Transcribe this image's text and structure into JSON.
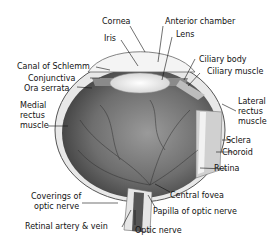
{
  "diagram": {
    "labels": {
      "cornea": "Cornea",
      "anterior_chamber": "Anterior chamber",
      "iris": "Iris",
      "lens": "Lens",
      "canal_of_schlemm": "Canal of Schlemm",
      "ciliary_body": "Ciliary body",
      "conjunctiva": "Conjunctiva",
      "ciliary_muscle": "Ciliary muscle",
      "ora_serrata": "Ora serrata",
      "medial_rectus_1": "Medial",
      "medial_rectus_2": "rectus",
      "medial_rectus_3": "muscle",
      "lateral_rectus_1": "Lateral",
      "lateral_rectus_2": "rectus",
      "lateral_rectus_3": "muscle",
      "sclera": "Sclera",
      "choroid": "Choroid",
      "retina": "Retina",
      "coverings_1": "Coverings of",
      "coverings_2": "optic nerve",
      "central_fovea": "Central fovea",
      "papilla": "Papilla of optic nerve",
      "retinal_artery_vein": "Retinal artery & vein",
      "optic_nerve": "Optic nerve"
    }
  }
}
